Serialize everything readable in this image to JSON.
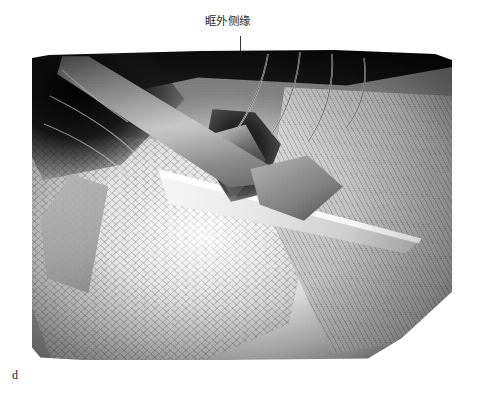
{
  "figure": {
    "panel_letter": "d",
    "image_kind": "surgical-photograph",
    "color_mode": "grayscale"
  },
  "annotations": [
    {
      "id": "lateral-orbital-rim",
      "label": "眶外侧缘",
      "leader": {
        "orientation": "vertical",
        "x": 240,
        "y_start": 36,
        "y_end": 130
      }
    }
  ],
  "photo": {
    "left": 32,
    "top": 50,
    "width": 420,
    "height": 310,
    "features": [
      "surgical-elevator-retractor",
      "suture-threads",
      "periosteal-flap",
      "temporalis-muscle-sheet",
      "deep-orbital-cleft",
      "woven-gauze-texture"
    ]
  },
  "colors": {
    "page_background": "#ffffff",
    "label_text": "#2b2b2b",
    "leader_line": "#3a3a3a",
    "panel_letter": "#1a1a1a",
    "photo_dark": "#0b0b0a",
    "photo_mid": "#8e8e88",
    "photo_light": "#f2f1ec"
  }
}
